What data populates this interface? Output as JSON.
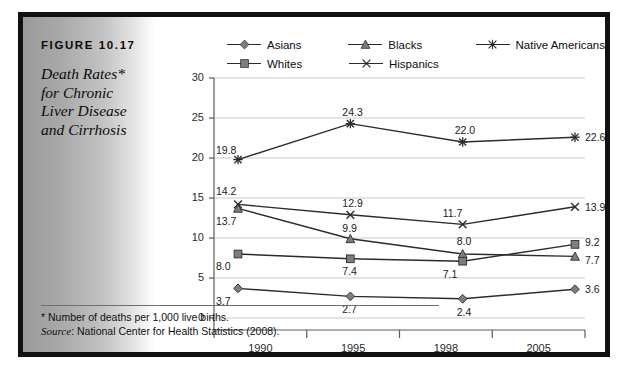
{
  "figure": {
    "number": "FIGURE 10.17",
    "title_lines": [
      "Death Rates*",
      "for Chronic",
      "Liver Disease",
      "and Cirrhosis"
    ],
    "footnote": "*  Number of deaths per 1,000 live births.",
    "source_label": "Source",
    "source_text": ": National Center for Health Statistics (2008)."
  },
  "legend": {
    "rows": [
      [
        {
          "label": "Asians",
          "marker": "diamond-marker-icon"
        },
        {
          "label": "Blacks",
          "marker": "triangle-marker-icon"
        },
        {
          "label": "Native Americans",
          "marker": "asterisk-marker-icon"
        }
      ],
      [
        {
          "label": "Whites",
          "marker": "square-marker-icon"
        },
        {
          "label": "Hispanics",
          "marker": "cross-marker-icon"
        }
      ]
    ]
  },
  "chart_data": {
    "type": "line",
    "title": "Death Rates* for Chronic Liver Disease and Cirrhosis",
    "xlabel": "",
    "ylabel": "",
    "categories": [
      "1990",
      "1995",
      "1998",
      "2005"
    ],
    "ylim": [
      0,
      30
    ],
    "yticks": [
      0,
      5,
      10,
      15,
      20,
      25,
      30
    ],
    "grid": true,
    "legend_position": "top",
    "series": [
      {
        "name": "Asians",
        "marker": "diamond",
        "color": "#6e6e6e",
        "values": [
          3.7,
          2.7,
          2.4,
          3.6
        ],
        "labels": [
          "3.7",
          "2.7",
          "2.4",
          "3.6"
        ]
      },
      {
        "name": "Blacks",
        "marker": "triangle",
        "color": "#6e6e6e",
        "values": [
          13.7,
          9.9,
          8.0,
          7.7
        ],
        "labels": [
          "13.7",
          "9.9",
          "8.0",
          "7.7"
        ]
      },
      {
        "name": "Native Americans",
        "marker": "asterisk",
        "color": "#2b2b2b",
        "values": [
          19.8,
          24.3,
          22.0,
          22.6
        ],
        "labels": [
          "19.8",
          "24.3",
          "22.0",
          "22.6"
        ]
      },
      {
        "name": "Whites",
        "marker": "square",
        "color": "#6e6e6e",
        "values": [
          8.0,
          7.4,
          7.1,
          9.2
        ],
        "labels": [
          "8.0",
          "7.4",
          "7.1",
          "9.2"
        ]
      },
      {
        "name": "Hispanics",
        "marker": "cross",
        "color": "#2b2b2b",
        "values": [
          14.2,
          12.9,
          11.7,
          13.9
        ],
        "labels": [
          "14.2",
          "12.9",
          "11.7",
          "13.9"
        ]
      }
    ],
    "colors": {
      "line": "#2b2b2b",
      "marker_fill": "#7d7d7d",
      "grid": "#c9c9c9",
      "axis": "#5a5a5a"
    }
  }
}
